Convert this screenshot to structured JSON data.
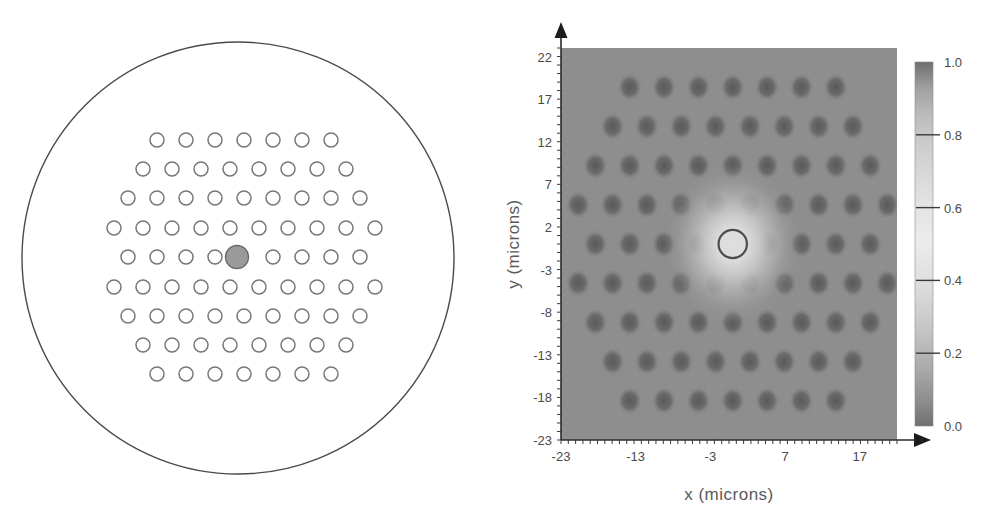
{
  "figure": {
    "background_color": "#ffffff"
  },
  "left_panel": {
    "name": "fiber-cross-section",
    "cladding_outline_color": "#4a4a4a",
    "hole_outline_color": "#777777",
    "core_fill_color": "#9a9a9a",
    "core_outline_color": "#6a6a6a",
    "cladding": {
      "center_x": 238,
      "center_y": 258,
      "radius": 216
    },
    "core": {
      "center_x": 237,
      "center_y": 257,
      "radius": 11.5,
      "label": "doped-core-defect"
    },
    "hole_radius": 7.0,
    "lattice_rows": [
      {
        "y": 140,
        "x_start": 157,
        "spacing": 29.0,
        "count": 7
      },
      {
        "y": 169,
        "x_start": 143,
        "spacing": 29.0,
        "count": 8
      },
      {
        "y": 198,
        "x_start": 128,
        "spacing": 29.0,
        "count": 9
      },
      {
        "y": 228,
        "x_start": 114,
        "spacing": 29.0,
        "count": 10
      },
      {
        "y": 257,
        "x_start": 128,
        "spacing": 29.0,
        "count": 9
      },
      {
        "y": 287,
        "x_start": 114,
        "spacing": 29.0,
        "count": 10
      },
      {
        "y": 316,
        "x_start": 128,
        "spacing": 29.0,
        "count": 9
      },
      {
        "y": 345,
        "x_start": 143,
        "spacing": 29.0,
        "count": 8
      },
      {
        "y": 374,
        "x_start": 157,
        "spacing": 29.0,
        "count": 7
      }
    ],
    "core_row_index": 4,
    "core_col_index": 4
  },
  "chart_data": {
    "type": "heatmap",
    "title": "",
    "xlabel": "x  (microns)",
    "ylabel": "y  (microns)",
    "xticks": [
      -23,
      -13,
      -3,
      7,
      17
    ],
    "yticks": [
      22,
      17,
      12,
      7,
      2,
      -3,
      -8,
      -13,
      -18,
      -23
    ],
    "xlim": [
      -23,
      22
    ],
    "ylim": [
      -23,
      23
    ],
    "grid": false,
    "colorbar": {
      "label": "",
      "ticks": [
        0.0,
        0.2,
        0.4,
        0.6,
        0.8,
        1.0
      ],
      "tick_labels": [
        "0.0",
        "0.2",
        "0.4",
        "0.6",
        "0.8",
        "1.0"
      ],
      "vmin": 0.0,
      "vmax": 1.0,
      "colormap": "grayscale",
      "position": "right"
    },
    "field": {
      "description": "Normalized fundamental mode intensity of a photonic crystal fiber; bright Gaussian peak at the solid core defect, dark air holes on hexagonal lattice over uniform silica background",
      "background_level": 0.45,
      "hole_level": 0.18,
      "peak_level": 1.0,
      "peak_x": 0.0,
      "peak_y": 0.0,
      "peak_sigma_microns": 4.6,
      "hole_radius_microns": 1.7,
      "lattice_pitch_microns": 4.6,
      "core_contour_radius_microns": 1.9,
      "noise_amplitude": 0.05
    },
    "lattice_rows_microns": [
      {
        "y": 18.4,
        "x_start": -13.8,
        "spacing": 4.6,
        "count": 7
      },
      {
        "y": 13.8,
        "x_start": -16.1,
        "spacing": 4.6,
        "count": 8
      },
      {
        "y": 9.2,
        "x_start": -18.4,
        "spacing": 4.6,
        "count": 9
      },
      {
        "y": 4.6,
        "x_start": -20.7,
        "spacing": 4.6,
        "count": 10
      },
      {
        "y": 0.0,
        "x_start": -18.4,
        "spacing": 4.6,
        "count": 9
      },
      {
        "y": -4.6,
        "x_start": -20.7,
        "spacing": 4.6,
        "count": 10
      },
      {
        "y": -9.2,
        "x_start": -18.4,
        "spacing": 4.6,
        "count": 9
      },
      {
        "y": -13.8,
        "x_start": -16.1,
        "spacing": 4.6,
        "count": 8
      },
      {
        "y": -18.4,
        "x_start": -13.8,
        "spacing": 4.6,
        "count": 7
      }
    ],
    "core_row_index": 4,
    "core_col_index": 4
  },
  "right_panel": {
    "name": "mode-field-map",
    "plot_area": {
      "left": 64,
      "top": 48,
      "width": 336,
      "height": 392
    },
    "axis_color": "#2b2b2b",
    "colorbar_box": {
      "left": 418,
      "top": 62,
      "width": 18,
      "height": 364
    }
  }
}
